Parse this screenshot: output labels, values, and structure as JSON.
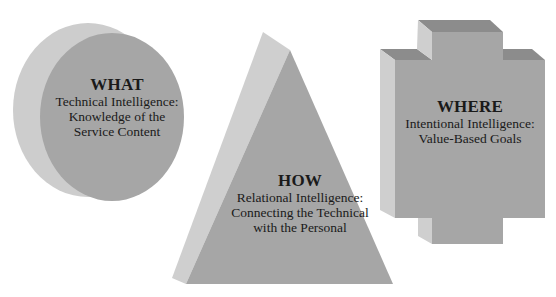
{
  "shapes": {
    "what": {
      "title": "WHAT",
      "line1": "Technical Intelligence:",
      "line2": "Knowledge of the",
      "line3": "Service Content",
      "shape": "cylinder-disk"
    },
    "how": {
      "title": "HOW",
      "line1": "Relational Intelligence:",
      "line2": "Connecting the Technical",
      "line3": "with the Personal",
      "shape": "pyramid"
    },
    "where": {
      "title": "WHERE",
      "line1": "Intentional Intelligence:",
      "line2": "Value-Based Goals",
      "shape": "cross-block"
    }
  },
  "colors": {
    "background": "#ffffff",
    "front_face": "#a6a6a6",
    "side_face_light": "#cfcfcf",
    "top_face_dark": "#8c8c8c",
    "text": "#1a1a1a"
  }
}
